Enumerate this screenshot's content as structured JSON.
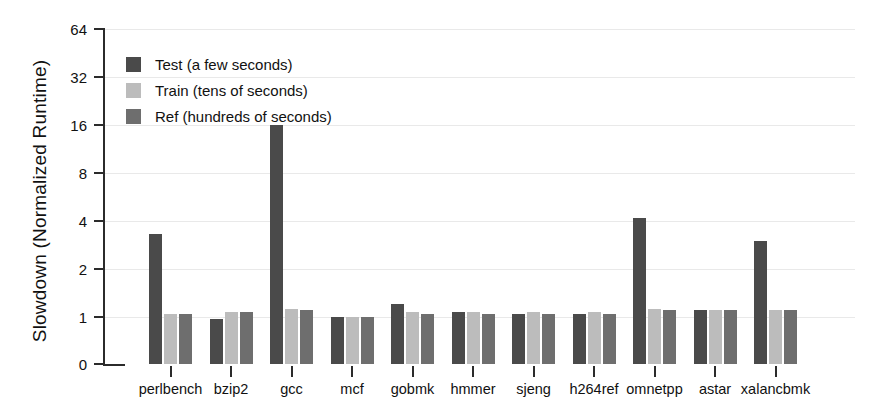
{
  "chart_data": {
    "type": "bar",
    "title": "",
    "xlabel": "",
    "ylabel": "Slowdown (Normalized Runtime)",
    "yscale": "log2-with-zero-break",
    "yticks": [
      0,
      1,
      2,
      4,
      8,
      16,
      32,
      64
    ],
    "ytick_labels": [
      "0",
      "1",
      "2",
      "4",
      "8",
      "16",
      "32",
      "64"
    ],
    "ylim": [
      0,
      90
    ],
    "grid": true,
    "legend_position": "upper-left-inside",
    "categories": [
      "perlbench",
      "bzip2",
      "gcc",
      "mcf",
      "gobmk",
      "hmmer",
      "sjeng",
      "h264ref",
      "omnetpp",
      "astar",
      "xalancbmk"
    ],
    "series": [
      {
        "name": "Test (a few seconds)",
        "short_name": "Test",
        "color": "#4a4a4a",
        "values": [
          3.3,
          0.97,
          16.0,
          1.0,
          1.2,
          1.08,
          1.05,
          1.05,
          4.2,
          1.1,
          3.0
        ]
      },
      {
        "name": "Train (tens of seconds)",
        "short_name": "Train",
        "color": "#bcbcbc",
        "values": [
          1.05,
          1.08,
          1.12,
          1.0,
          1.08,
          1.08,
          1.08,
          1.08,
          1.12,
          1.1,
          1.1
        ]
      },
      {
        "name": "Ref (hundreds of seconds)",
        "short_name": "Ref",
        "color": "#6e6e6e",
        "values": [
          1.05,
          1.08,
          1.1,
          1.0,
          1.05,
          1.05,
          1.05,
          1.05,
          1.1,
          1.1,
          1.1
        ]
      }
    ]
  },
  "colors": {
    "axis": "#2b2b2b",
    "grid": "#e9e9e9",
    "text": "#111111",
    "background": "#ffffff"
  }
}
